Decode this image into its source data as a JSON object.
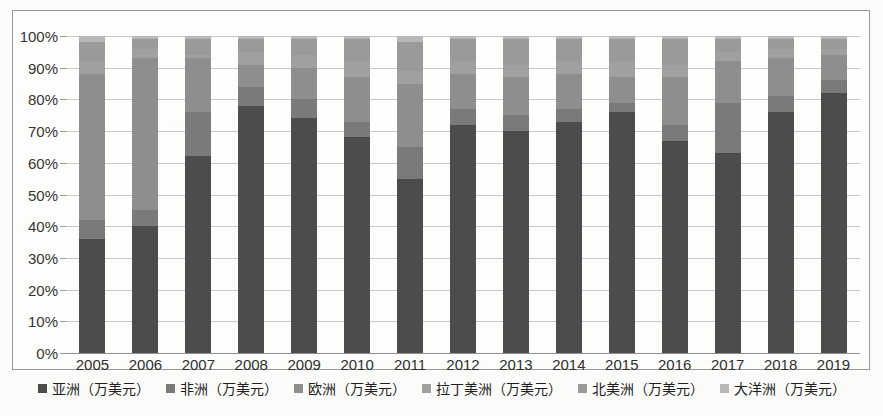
{
  "chart_data": {
    "type": "bar",
    "subtype": "stacked-percentage",
    "title": "",
    "xlabel": "",
    "ylabel": "",
    "ylim": [
      0,
      100
    ],
    "yunit": "%",
    "grid": true,
    "legend_position": "bottom",
    "categories": [
      "2005",
      "2006",
      "2007",
      "2008",
      "2009",
      "2010",
      "2011",
      "2012",
      "2013",
      "2014",
      "2015",
      "2016",
      "2017",
      "2018",
      "2019"
    ],
    "ytick_labels": [
      "0%",
      "10%",
      "20%",
      "30%",
      "40%",
      "50%",
      "60%",
      "70%",
      "80%",
      "90%",
      "100%"
    ],
    "ytick_values": [
      0,
      10,
      20,
      30,
      40,
      50,
      60,
      70,
      80,
      90,
      100
    ],
    "series": [
      {
        "name": "亚洲（万美元）",
        "color": "#4c4c4c",
        "values": [
          36,
          40,
          62,
          78,
          74,
          68,
          55,
          72,
          70,
          73,
          76,
          67,
          63,
          76,
          82
        ]
      },
      {
        "name": "非洲（万美元）",
        "color": "#7a7a7a",
        "values": [
          6,
          5,
          14,
          6,
          6,
          5,
          10,
          5,
          5,
          4,
          3,
          5,
          16,
          5,
          4
        ]
      },
      {
        "name": "欧洲（万美元）",
        "color": "#8e8e8e",
        "values": [
          46,
          48,
          17,
          7,
          10,
          14,
          20,
          11,
          12,
          11,
          8,
          15,
          13,
          12,
          8
        ]
      },
      {
        "name": "拉丁美洲（万美元）",
        "color": "#a0a0a0",
        "values": [
          4,
          3,
          1,
          4,
          4,
          5,
          4,
          4,
          4,
          4,
          5,
          4,
          3,
          3,
          2
        ]
      },
      {
        "name": "北美洲（万美元）",
        "color": "#9a9a9a",
        "values": [
          6,
          3,
          5,
          4,
          5,
          7,
          9,
          7,
          8,
          7,
          7,
          8,
          4,
          3,
          3
        ]
      },
      {
        "name": "大洋洲（万美元）",
        "color": "#b8b8b8",
        "values": [
          2,
          1,
          1,
          1,
          1,
          1,
          2,
          1,
          1,
          1,
          1,
          1,
          1,
          1,
          1
        ]
      }
    ]
  },
  "axis": {
    "y_ticks": [
      "100%",
      "90%",
      "80%",
      "70%",
      "60%",
      "50%",
      "40%",
      "30%",
      "20%",
      "10%",
      "0%"
    ]
  }
}
